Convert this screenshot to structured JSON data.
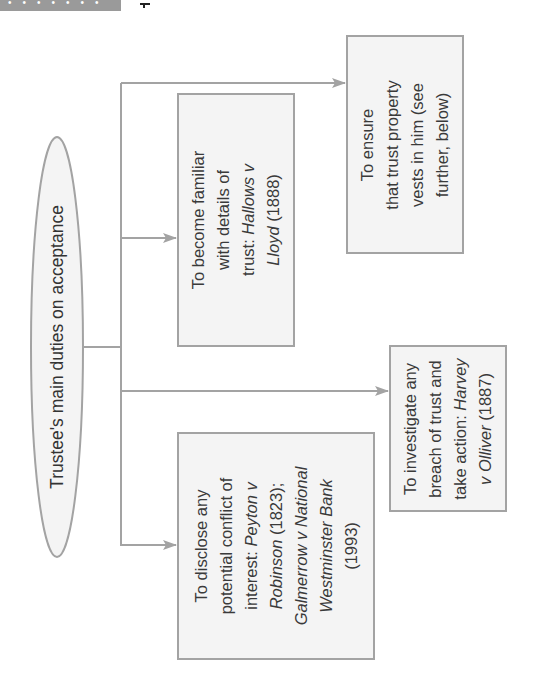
{
  "header": {
    "page_marker": "1",
    "bar_color": "#9a9a9a"
  },
  "diagram": {
    "root": {
      "label": "Trustee's main duties on acceptance"
    },
    "branches": [
      {
        "id": "ensure-vesting",
        "lines": [
          "To ensure",
          "that trust property",
          "vests in him (see",
          "further, below)"
        ]
      },
      {
        "id": "become-familiar",
        "lines_pre": [
          "To become familiar",
          "with details of"
        ],
        "line3_plain": "trust: ",
        "line3_italic": "Hallows v",
        "line4_italic": "Lloyd",
        "line4_plain": " (1888)"
      },
      {
        "id": "investigate-breach",
        "lines_pre": [
          "To investigate any",
          "breach of trust and"
        ],
        "line3_plain": "take action: ",
        "line3_italic": "Harvey",
        "line4_italic": "v Olliver",
        "line4_plain": " (1887)"
      },
      {
        "id": "disclose-conflict",
        "lines_pre": [
          "To disclose any",
          "potential conflict of"
        ],
        "line3_plain": "interest: ",
        "line3_italic": "Peyton v",
        "line4_italic": "Robinson",
        "line4_plain": " (1823);",
        "line5_italic": "Galmerrow v National",
        "line6_italic": "Westminster Bank",
        "line7_plain": "(1993)"
      }
    ],
    "colors": {
      "line": "#a3a3a3",
      "box_fill": "#f4f4f4",
      "box_border": "#a3a3a3",
      "text": "#333333"
    }
  }
}
